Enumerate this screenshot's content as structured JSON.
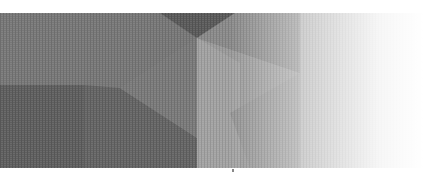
{
  "banner": {
    "description": "decorative geometric polygon background",
    "colors": {
      "darkest": "#585858",
      "dark": "#626262",
      "mid": "#747474",
      "mid_light": "#808080",
      "light": "#9a9a9a",
      "lighter": "#a8a8a8",
      "fade_to": "#ffffff"
    }
  }
}
